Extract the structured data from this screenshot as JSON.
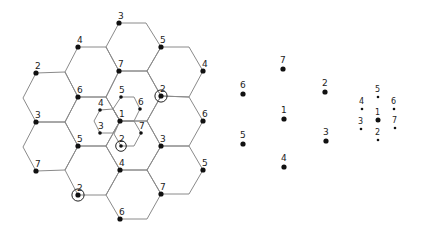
{
  "diagram": {
    "type": "hexagonal-cell-reuse-pattern",
    "cluster_size": 7,
    "hex_grid": {
      "hexagons": [
        [
          [
            119,
            23
          ],
          [
            146,
            23
          ],
          [
            161,
            47
          ],
          [
            147,
            71
          ],
          [
            119,
            71
          ],
          [
            106,
            47
          ]
        ],
        [
          [
            78,
            47
          ],
          [
            106,
            47
          ],
          [
            119,
            71
          ],
          [
            106,
            97
          ],
          [
            78,
            97
          ],
          [
            65,
            72
          ]
        ],
        [
          [
            36,
            73
          ],
          [
            65,
            72
          ],
          [
            78,
            97
          ],
          [
            65,
            122
          ],
          [
            36,
            122
          ],
          [
            23,
            98
          ]
        ],
        [
          [
            161,
            47
          ],
          [
            189,
            47
          ],
          [
            203,
            71
          ],
          [
            189,
            97
          ],
          [
            161,
            96
          ],
          [
            147,
            71
          ]
        ],
        [
          [
            119,
            71
          ],
          [
            147,
            71
          ],
          [
            161,
            96
          ],
          [
            147,
            121
          ],
          [
            120,
            121
          ],
          [
            106,
            97
          ]
        ],
        [
          [
            161,
            96
          ],
          [
            189,
            97
          ],
          [
            203,
            121
          ],
          [
            189,
            146
          ],
          [
            161,
            146
          ],
          [
            147,
            121
          ]
        ],
        [
          [
            78,
            97
          ],
          [
            106,
            97
          ],
          [
            120,
            121
          ],
          [
            106,
            146
          ],
          [
            78,
            146
          ],
          [
            65,
            122
          ]
        ],
        [
          [
            36,
            122
          ],
          [
            65,
            122
          ],
          [
            78,
            146
          ],
          [
            65,
            170
          ],
          [
            36,
            171
          ],
          [
            23,
            147
          ]
        ],
        [
          [
            120,
            121
          ],
          [
            147,
            121
          ],
          [
            161,
            146
          ],
          [
            147,
            170
          ],
          [
            120,
            170
          ],
          [
            106,
            146
          ]
        ],
        [
          [
            161,
            146
          ],
          [
            189,
            146
          ],
          [
            203,
            170
          ],
          [
            189,
            194
          ],
          [
            161,
            194
          ],
          [
            147,
            170
          ]
        ],
        [
          [
            78,
            146
          ],
          [
            106,
            146
          ],
          [
            120,
            170
          ],
          [
            106,
            195
          ],
          [
            78,
            195
          ],
          [
            65,
            170
          ]
        ],
        [
          [
            120,
            170
          ],
          [
            147,
            170
          ],
          [
            161,
            194
          ],
          [
            147,
            219
          ],
          [
            120,
            219
          ],
          [
            106,
            195
          ]
        ]
      ],
      "small_hexagons": [
        [
          [
            121,
            97
          ],
          [
            134,
            97
          ],
          [
            140,
            109
          ],
          [
            134,
            121
          ],
          [
            120,
            121
          ],
          [
            113,
            109
          ]
        ],
        [
          [
            120,
            121
          ],
          [
            134,
            121
          ],
          [
            141,
            133
          ],
          [
            134,
            146
          ],
          [
            121,
            146
          ],
          [
            114,
            134
          ]
        ],
        [
          [
            100,
            110
          ],
          [
            113,
            109
          ],
          [
            120,
            121
          ],
          [
            113,
            133
          ],
          [
            100,
            133
          ],
          [
            94,
            121
          ]
        ]
      ],
      "nodes": [
        {
          "label": "3",
          "x": 119,
          "y": 23
        },
        {
          "label": "5",
          "x": 161,
          "y": 47
        },
        {
          "label": "4",
          "x": 78,
          "y": 47
        },
        {
          "label": "4",
          "x": 203,
          "y": 71
        },
        {
          "label": "7",
          "x": 119,
          "y": 71
        },
        {
          "label": "2",
          "x": 36,
          "y": 73
        },
        {
          "label": "6",
          "x": 78,
          "y": 97
        },
        {
          "label": "2",
          "x": 161,
          "y": 96,
          "circled": true
        },
        {
          "label": "3",
          "x": 36,
          "y": 122
        },
        {
          "label": "6",
          "x": 203,
          "y": 121
        },
        {
          "label": "1",
          "x": 120,
          "y": 121
        },
        {
          "label": "5",
          "x": 78,
          "y": 146
        },
        {
          "label": "3",
          "x": 161,
          "y": 146
        },
        {
          "label": "7",
          "x": 36,
          "y": 171
        },
        {
          "label": "5",
          "x": 203,
          "y": 170
        },
        {
          "label": "4",
          "x": 120,
          "y": 170
        },
        {
          "label": "2",
          "x": 78,
          "y": 195,
          "circled": true
        },
        {
          "label": "7",
          "x": 161,
          "y": 194
        },
        {
          "label": "6",
          "x": 120,
          "y": 219
        }
      ],
      "small_nodes": [
        {
          "label": "5",
          "x": 121,
          "y": 97
        },
        {
          "label": "6",
          "x": 140,
          "y": 109
        },
        {
          "label": "4",
          "x": 100,
          "y": 110
        },
        {
          "label": "3",
          "x": 100,
          "y": 133
        },
        {
          "label": "7",
          "x": 141,
          "y": 133
        },
        {
          "label": "2",
          "x": 121,
          "y": 146,
          "circled": true
        }
      ]
    },
    "mid_pattern": {
      "nodes": [
        {
          "label": "7",
          "x": 283,
          "y": 69
        },
        {
          "label": "6",
          "x": 243,
          "y": 94
        },
        {
          "label": "2",
          "x": 325,
          "y": 92
        },
        {
          "label": "1",
          "x": 284,
          "y": 119
        },
        {
          "label": "5",
          "x": 243,
          "y": 144
        },
        {
          "label": "3",
          "x": 326,
          "y": 141
        },
        {
          "label": "4",
          "x": 284,
          "y": 167
        }
      ]
    },
    "small_pattern": {
      "nodes": [
        {
          "label": "5",
          "x": 378,
          "y": 97
        },
        {
          "label": "4",
          "x": 362,
          "y": 109
        },
        {
          "label": "6",
          "x": 394,
          "y": 109
        },
        {
          "label": "1",
          "x": 378,
          "y": 120,
          "large": true
        },
        {
          "label": "3",
          "x": 361,
          "y": 129
        },
        {
          "label": "7",
          "x": 395,
          "y": 128
        },
        {
          "label": "2",
          "x": 378,
          "y": 140
        }
      ]
    },
    "colors": {
      "edge": "#8a8a8a",
      "dot": "#111111",
      "label": "#222222",
      "background": "#ffffff"
    }
  }
}
